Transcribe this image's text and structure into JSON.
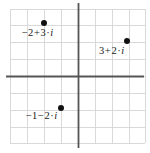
{
  "figure": {
    "kind": "complex-plane-scatter",
    "width": 150,
    "height": 153,
    "background": "#ffffff"
  },
  "chart_data": {
    "type": "scatter",
    "title": "",
    "xlabel": "",
    "ylabel": "",
    "xlim": [
      -4,
      4
    ],
    "ylim": [
      -4,
      4
    ],
    "grid": true,
    "legend": null,
    "grid_spacing": 1,
    "axis_color": "#555555",
    "grid_color": "#d9d9d9",
    "point_color": "#111111",
    "origin_px": {
      "x": 78,
      "y": 76
    },
    "unit_px": 17,
    "points": [
      {
        "id": "p1",
        "re": -2,
        "im": 3,
        "label": "-2+3·i",
        "label_parts": {
          "re_sign": "−",
          "re": "2",
          "op": "+",
          "im": "3",
          "cdot": "·",
          "unit": "i"
        },
        "px": {
          "x": 44,
          "y": 23
        },
        "label_px": {
          "x": 22,
          "y": 28
        }
      },
      {
        "id": "p2",
        "re": 3,
        "im": 2,
        "label": "3+2·i",
        "label_parts": {
          "re_sign": "",
          "re": "3",
          "op": "+",
          "im": "2",
          "cdot": "·",
          "unit": "i"
        },
        "px": {
          "x": 127,
          "y": 41
        },
        "label_px": {
          "x": 99,
          "y": 46
        }
      },
      {
        "id": "p3",
        "re": -1,
        "im": -2,
        "label": "-1-2·i",
        "label_parts": {
          "re_sign": "−",
          "re": "1",
          "op": "−",
          "im": "2",
          "cdot": "·",
          "unit": "i"
        },
        "px": {
          "x": 61,
          "y": 108
        },
        "label_px": {
          "x": 26,
          "y": 111
        }
      }
    ],
    "grid_lines": {
      "vertical_px": [
        10,
        27,
        44,
        61,
        78,
        95,
        112,
        129,
        145
      ],
      "horizontal_px": [
        9,
        25,
        42,
        59,
        76,
        93,
        110,
        127,
        143
      ]
    }
  }
}
